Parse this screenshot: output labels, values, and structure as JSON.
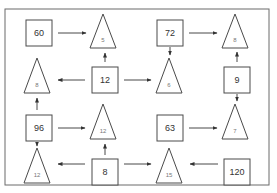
{
  "diagram": {
    "colors": {
      "stroke": "#4a4a4a",
      "frame": "#6b6b6b",
      "square_text": "#333333",
      "triangle_text": "#777777"
    },
    "frame": {
      "x": 5,
      "y": 9,
      "w": 264,
      "h": 176
    },
    "squares": [
      {
        "id": "sq60",
        "label": "60",
        "x": 26,
        "y": 20,
        "size": 26
      },
      {
        "id": "sq72",
        "label": "72",
        "x": 157,
        "y": 20,
        "size": 26
      },
      {
        "id": "sq12",
        "label": "12",
        "x": 92,
        "y": 67,
        "size": 26
      },
      {
        "id": "sq9",
        "label": "9",
        "x": 224,
        "y": 67,
        "size": 26
      },
      {
        "id": "sq96",
        "label": "96",
        "x": 26,
        "y": 115,
        "size": 26
      },
      {
        "id": "sq63",
        "label": "63",
        "x": 157,
        "y": 115,
        "size": 26
      },
      {
        "id": "sq8",
        "label": "8",
        "x": 92,
        "y": 159,
        "size": 26
      },
      {
        "id": "sq120",
        "label": "120",
        "x": 224,
        "y": 159,
        "size": 26
      }
    ],
    "triangles": [
      {
        "id": "t5",
        "label": "5",
        "cx": 103,
        "top": 14,
        "bottom": 48
      },
      {
        "id": "t8a",
        "label": "8",
        "cx": 235,
        "top": 14,
        "bottom": 48
      },
      {
        "id": "t8b",
        "label": "8",
        "cx": 37,
        "top": 58,
        "bottom": 93
      },
      {
        "id": "t6",
        "label": "6",
        "cx": 169,
        "top": 58,
        "bottom": 93
      },
      {
        "id": "t12a",
        "label": "12",
        "cx": 103,
        "top": 104,
        "bottom": 139
      },
      {
        "id": "t7",
        "label": "7",
        "cx": 235,
        "top": 104,
        "bottom": 139
      },
      {
        "id": "t12b",
        "label": "12",
        "cx": 37,
        "top": 148,
        "bottom": 183
      },
      {
        "id": "t15",
        "label": "15",
        "cx": 169,
        "top": 148,
        "bottom": 183
      }
    ],
    "arrows": [
      {
        "from": "60",
        "to": "5",
        "x1": 58,
        "y1": 33,
        "x2": 86,
        "y2": 33
      },
      {
        "from": "12",
        "to": "5",
        "x1": 105,
        "y1": 62,
        "x2": 105,
        "y2": 53
      },
      {
        "from": "12",
        "to": "8-left",
        "x1": 85,
        "y1": 80,
        "x2": 58,
        "y2": 80
      },
      {
        "from": "12",
        "to": "6",
        "x1": 124,
        "y1": 80,
        "x2": 151,
        "y2": 80
      },
      {
        "from": "72",
        "to": "6",
        "x1": 170,
        "y1": 47,
        "x2": 170,
        "y2": 55
      },
      {
        "from": "72",
        "to": "8-top",
        "x1": 189,
        "y1": 33,
        "x2": 217,
        "y2": 33
      },
      {
        "from": "9",
        "to": "8-top",
        "x1": 237,
        "y1": 62,
        "x2": 237,
        "y2": 52
      },
      {
        "from": "9",
        "to": "7",
        "x1": 237,
        "y1": 94,
        "x2": 237,
        "y2": 101
      },
      {
        "from": "96",
        "to": "8-left",
        "x1": 37,
        "y1": 110,
        "x2": 37,
        "y2": 98
      },
      {
        "from": "96",
        "to": "12-mid",
        "x1": 58,
        "y1": 128,
        "x2": 85,
        "y2": 128
      },
      {
        "from": "96",
        "to": "12-bot",
        "x1": 37,
        "y1": 142,
        "x2": 37,
        "y2": 146
      },
      {
        "from": "63",
        "to": "7",
        "x1": 189,
        "y1": 128,
        "x2": 217,
        "y2": 128
      },
      {
        "from": "8",
        "to": "12-mid",
        "x1": 105,
        "y1": 155,
        "x2": 105,
        "y2": 144
      },
      {
        "from": "8",
        "to": "12-bot",
        "x1": 85,
        "y1": 164,
        "x2": 58,
        "y2": 164
      },
      {
        "from": "8",
        "to": "15",
        "x1": 124,
        "y1": 164,
        "x2": 151,
        "y2": 164
      },
      {
        "from": "120",
        "to": "15",
        "x1": 218,
        "y1": 164,
        "x2": 190,
        "y2": 164
      }
    ]
  }
}
